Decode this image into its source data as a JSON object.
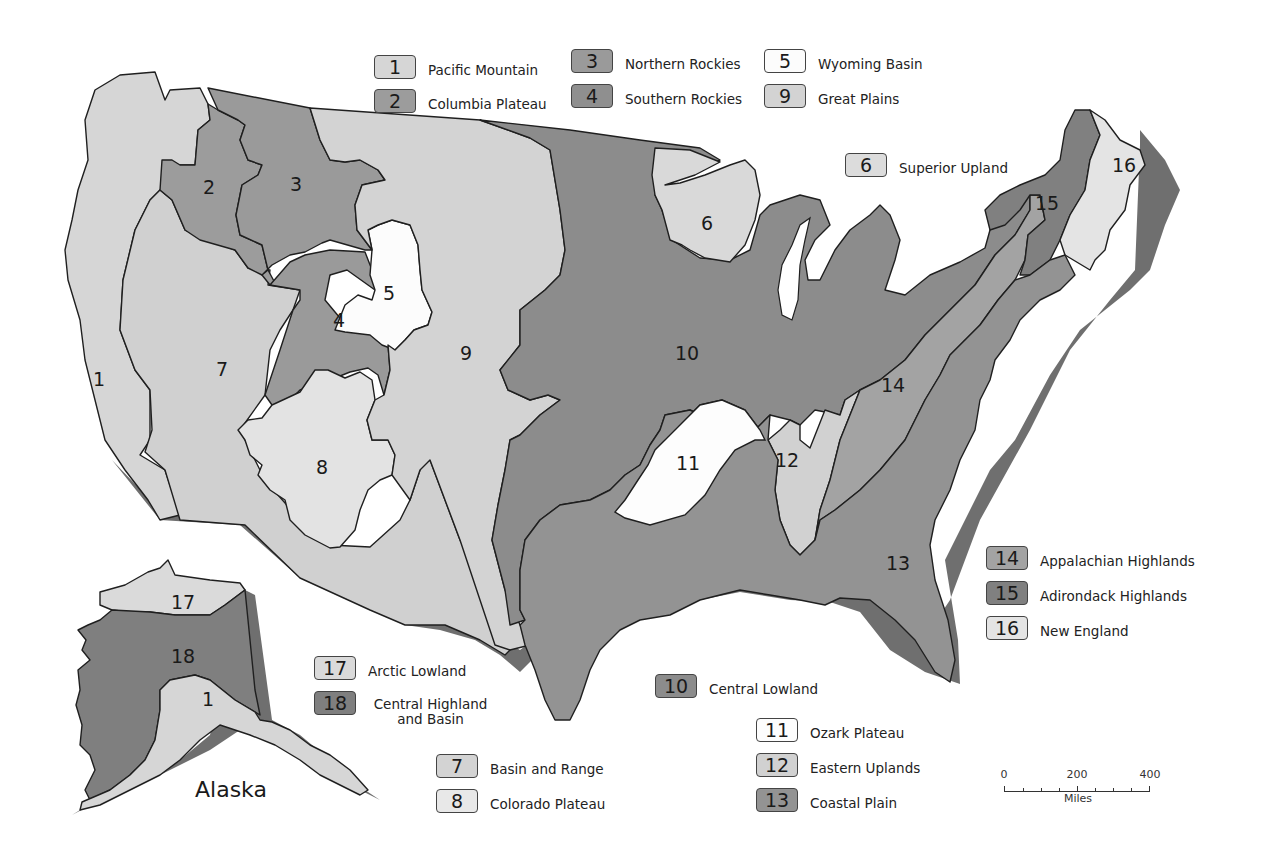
{
  "map": {
    "title_alaska": "Alaska",
    "colors": {
      "pacific_mountain": "#d6d6d6",
      "columbia_plateau": "#9c9c9c",
      "northern_rockies": "#9a9a9a",
      "southern_rockies": "#9a9a9a",
      "wyoming_basin": "#fcfcfc",
      "superior_upland": "#d9d9d9",
      "basin_and_range": "#d0d0d0",
      "colorado_plateau": "#e3e3e3",
      "great_plains": "#d3d3d3",
      "central_lowland": "#8c8c8c",
      "ozark_plateau": "#fdfdfd",
      "eastern_uplands": "#d1d1d1",
      "coastal_plain": "#939393",
      "appalachian_highlands": "#a3a3a3",
      "adirondack_highlands": "#808080",
      "new_england": "#e4e4e4",
      "arctic_lowland": "#dadada",
      "central_highland_and_basin": "#7f7f7f"
    },
    "region_labels": [
      {
        "id": "1",
        "x": 99,
        "y": 386
      },
      {
        "id": "2",
        "x": 209,
        "y": 194
      },
      {
        "id": "3",
        "x": 296,
        "y": 191
      },
      {
        "id": "4",
        "x": 339,
        "y": 327
      },
      {
        "id": "5",
        "x": 389,
        "y": 300
      },
      {
        "id": "6",
        "x": 707,
        "y": 230
      },
      {
        "id": "7",
        "x": 222,
        "y": 376
      },
      {
        "id": "8",
        "x": 322,
        "y": 474
      },
      {
        "id": "9",
        "x": 466,
        "y": 360
      },
      {
        "id": "10",
        "x": 687,
        "y": 360
      },
      {
        "id": "11",
        "x": 688,
        "y": 470
      },
      {
        "id": "12",
        "x": 787,
        "y": 467
      },
      {
        "id": "13",
        "x": 898,
        "y": 570
      },
      {
        "id": "14",
        "x": 893,
        "y": 392
      },
      {
        "id": "15",
        "x": 1047,
        "y": 210
      },
      {
        "id": "16",
        "x": 1124,
        "y": 172
      },
      {
        "id": "17",
        "x": 183,
        "y": 609
      },
      {
        "id": "18",
        "x": 183,
        "y": 663
      },
      {
        "id": "1",
        "x": 208,
        "y": 706
      }
    ]
  },
  "legend": [
    {
      "num": "1",
      "label": "Pacific Mountain",
      "color": "#d6d6d6",
      "x": 374,
      "y": 54
    },
    {
      "num": "2",
      "label": "Columbia Plateau",
      "color": "#9c9c9c",
      "x": 374,
      "y": 88
    },
    {
      "num": "3",
      "label": "Northern Rockies",
      "color": "#9a9a9a",
      "x": 571,
      "y": 48
    },
    {
      "num": "4",
      "label": "Southern Rockies",
      "color": "#8f8f8f",
      "x": 571,
      "y": 83
    },
    {
      "num": "5",
      "label": "Wyoming Basin",
      "color": "#fcfcfc",
      "x": 764,
      "y": 48
    },
    {
      "num": "9",
      "label": "Great Plains",
      "color": "#d3d3d3",
      "x": 764,
      "y": 83
    },
    {
      "num": "6",
      "label": "Superior Upland",
      "color": "#dcdcdc",
      "x": 845,
      "y": 152
    },
    {
      "num": "14",
      "label": "Appalachian Highlands",
      "color": "#a3a3a3",
      "x": 986,
      "y": 545
    },
    {
      "num": "15",
      "label": "Adirondack Highlands",
      "color": "#808080",
      "x": 986,
      "y": 580
    },
    {
      "num": "16",
      "label": "New England",
      "color": "#e4e4e4",
      "x": 986,
      "y": 615
    },
    {
      "num": "17",
      "label": "Arctic Lowland",
      "color": "#dadada",
      "x": 314,
      "y": 655
    },
    {
      "num": "18",
      "label": "Central Highland and Basin",
      "color": "#7f7f7f",
      "x": 314,
      "y": 690,
      "two_line": true
    },
    {
      "num": "10",
      "label": "Central Lowland",
      "color": "#8c8c8c",
      "x": 655,
      "y": 673
    },
    {
      "num": "11",
      "label": "Ozark Plateau",
      "color": "#fdfdfd",
      "x": 756,
      "y": 717
    },
    {
      "num": "12",
      "label": "Eastern Uplands",
      "color": "#d1d1d1",
      "x": 756,
      "y": 752
    },
    {
      "num": "13",
      "label": "Coastal Plain",
      "color": "#939393",
      "x": 756,
      "y": 787
    },
    {
      "num": "7",
      "label": "Basin and Range",
      "color": "#d3d3d3",
      "x": 436,
      "y": 753
    },
    {
      "num": "8",
      "label": "Colorado Plateau",
      "color": "#e8e8e8",
      "x": 436,
      "y": 788
    }
  ],
  "scale_bar": {
    "ticks": [
      "0",
      "200",
      "400"
    ],
    "unit": "Miles"
  }
}
